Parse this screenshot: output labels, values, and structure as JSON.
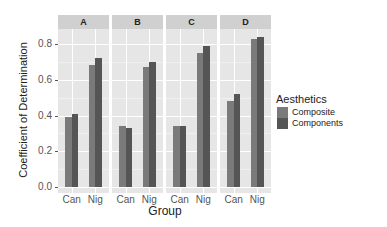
{
  "chart_data": {
    "type": "bar",
    "title": "",
    "xlabel": "Group",
    "ylabel": "Coefficient of Determination",
    "ylim": [
      0,
      0.85
    ],
    "yticks": [
      "0.0",
      "0.2",
      "0.4",
      "0.6",
      "0.8"
    ],
    "facets": [
      "A",
      "B",
      "C",
      "D"
    ],
    "categories": [
      "Can",
      "Nig"
    ],
    "legend": {
      "title": "Aesthetics",
      "position": "right",
      "entries": [
        "Composite",
        "Components"
      ]
    },
    "grid": true,
    "colors": {
      "Composite": "#7a7a7a",
      "Components": "#555555"
    },
    "panels": [
      {
        "facet": "A",
        "series": [
          {
            "name": "Composite",
            "values": [
              0.39,
              0.68
            ]
          },
          {
            "name": "Components",
            "values": [
              0.41,
              0.72
            ]
          }
        ]
      },
      {
        "facet": "B",
        "series": [
          {
            "name": "Composite",
            "values": [
              0.34,
              0.67
            ]
          },
          {
            "name": "Components",
            "values": [
              0.33,
              0.7
            ]
          }
        ]
      },
      {
        "facet": "C",
        "series": [
          {
            "name": "Composite",
            "values": [
              0.34,
              0.75
            ]
          },
          {
            "name": "Components",
            "values": [
              0.34,
              0.79
            ]
          }
        ]
      },
      {
        "facet": "D",
        "series": [
          {
            "name": "Composite",
            "values": [
              0.48,
              0.83
            ]
          },
          {
            "name": "Components",
            "values": [
              0.52,
              0.84
            ]
          }
        ]
      }
    ]
  }
}
